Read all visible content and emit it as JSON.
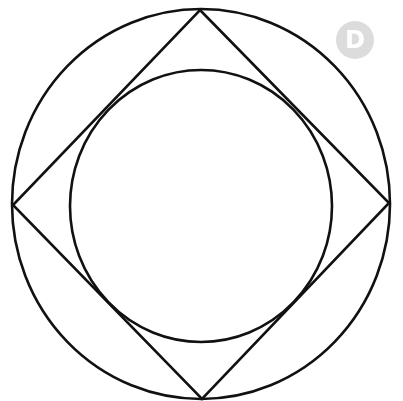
{
  "diagram": {
    "stroke_color": "#111111",
    "stroke_width": 2.6,
    "outer_circle": {
      "cx": 201,
      "cy": 204,
      "rx": 189,
      "ry": 195
    },
    "square": {
      "points": "200,10 389,203 202,399 13,205"
    },
    "inner_circle": {
      "cx": 201,
      "cy": 206,
      "rx": 131,
      "ry": 136
    }
  },
  "badge": {
    "label": "D",
    "background": "#dcdcdc",
    "text_color": "#ffffff"
  }
}
